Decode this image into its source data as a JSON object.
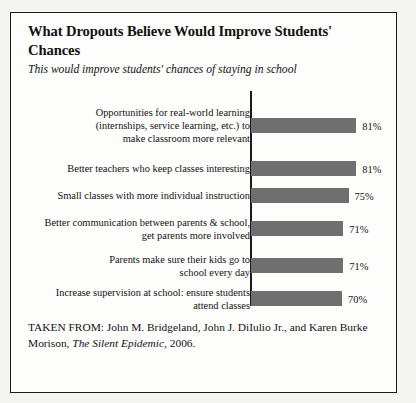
{
  "figure": {
    "title": "What Dropouts Believe Would Improve Students' Chances",
    "subtitle": "This would improve students' chances of staying in school",
    "source_prefix": "TAKEN FROM: John M. Bridgeland, John J. DiIulio Jr., and Karen Burke Morison, ",
    "source_work": "The Silent Epidemic",
    "source_suffix": ", 2006."
  },
  "chart_data": {
    "type": "bar",
    "orientation": "horizontal",
    "title": "What Dropouts Believe Would Improve Students' Chances",
    "subtitle": "This would improve students' chances of staying in school",
    "xlabel": "",
    "ylabel": "",
    "xlim": [
      0,
      100
    ],
    "grid": false,
    "legend": false,
    "value_suffix": "%",
    "bar_color": "#6f6f6f",
    "axis_color": "#1a1a1a",
    "categories": [
      "Opportunities for real-world learning (internships, service learning, etc.) to make classroom more relevant",
      "Better teachers who keep classes interesting",
      "Small classes with more individual instruction",
      "Better communication between parents & school, get parents more involved",
      "Parents make sure their kids go to school every day",
      "Increase supervision at school: ensure students attend classes"
    ],
    "category_lines": [
      [
        "Opportunities for real-world learning",
        "(internships, service learning, etc.) to",
        "make classroom more relevant"
      ],
      [
        "Better teachers who keep classes interesting"
      ],
      [
        "Small classes with more individual instruction"
      ],
      [
        "Better communication between parents & school,",
        "get parents more involved"
      ],
      [
        "Parents make sure their kids go to",
        "school every day"
      ],
      [
        "Increase supervision at school: ensure students",
        "attend classes"
      ]
    ],
    "values": [
      81,
      81,
      75,
      71,
      71,
      70
    ],
    "value_labels": [
      "81%",
      "81%",
      "75%",
      "71%",
      "71%",
      "70%"
    ]
  }
}
